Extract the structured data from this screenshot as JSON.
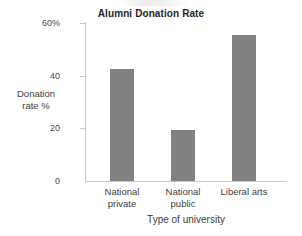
{
  "chart_data": {
    "type": "bar",
    "title": "Alumni Donation Rate",
    "xlabel": "Type of university",
    "ylabel": "Donation rate %",
    "categories": [
      "National private",
      "National public",
      "Liberal arts"
    ],
    "category_lines": [
      [
        "National",
        "private"
      ],
      [
        "National",
        "public"
      ],
      [
        "Liberal arts",
        ""
      ]
    ],
    "values": [
      42.5,
      19.5,
      55.4
    ],
    "ylim": [
      0,
      60
    ],
    "yticks": [
      0,
      20,
      40,
      60
    ],
    "ytick_labels": [
      "0",
      "20",
      "40",
      "60%"
    ],
    "grid": false,
    "legend": false,
    "bar_color": "#7f8183",
    "axis_color": "#c9c9c9",
    "background": "#ffffff"
  },
  "figure": {
    "title": "Alumni Donation Rate",
    "y_axis_label": "Donation rate %",
    "y_axis_label_line1": "Donation",
    "y_axis_label_line2": "rate %",
    "x_axis_label": "Type of university",
    "ticks": {
      "t60": "60%",
      "t40": "40",
      "t20": "20",
      "t0": "0"
    },
    "categories": {
      "c1_line1": "National",
      "c1_line2": "private",
      "c2_line1": "National",
      "c2_line2": "public",
      "c3_line1": "Liberal arts",
      "c3_line2": ""
    }
  }
}
